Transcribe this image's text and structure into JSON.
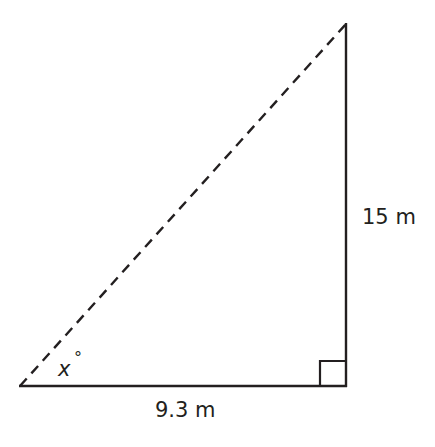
{
  "diagram": {
    "type": "right-triangle",
    "stroke_color": "#231f20",
    "background": "#ffffff",
    "vertices": {
      "bottom_left": [
        20,
        386
      ],
      "right_angle": [
        346,
        386
      ],
      "top": [
        346,
        24
      ]
    },
    "sides": {
      "base": {
        "label": "9.3 m",
        "style": "solid"
      },
      "height": {
        "label": "15 m",
        "style": "solid"
      },
      "hypotenuse": {
        "label": "",
        "style": "dashed"
      }
    },
    "angle": {
      "variable": "x",
      "unit": "°"
    },
    "right_angle_marker": true
  }
}
